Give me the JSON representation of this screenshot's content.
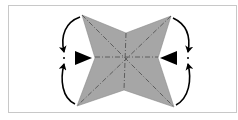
{
  "diagram": {
    "type": "origami-fold-step",
    "colors": {
      "paper": "#a6a6a6",
      "crease": "#555555",
      "arrow": "#000000",
      "frame": "#c8c8c8",
      "background": "#ffffff"
    },
    "shape": {
      "vertices": {
        "top_left": [
          82,
          15
        ],
        "top_notch": [
          126,
          33
        ],
        "top_right": [
          171,
          16
        ],
        "right_notch": [
          158,
          58
        ],
        "bottom_right": [
          174,
          107
        ],
        "bottom_notch": [
          124,
          90
        ],
        "bottom_left": [
          77,
          106
        ],
        "left_notch": [
          95,
          58
        ]
      },
      "center": [
        126,
        56
      ]
    },
    "symbols": [
      {
        "name": "push-arrow-left",
        "meaning": "push in / squash"
      },
      {
        "name": "push-arrow-right",
        "meaning": "push in / squash"
      },
      {
        "name": "fold-arrow-top-left",
        "meaning": "fold corner down to meet"
      },
      {
        "name": "fold-arrow-bottom-left",
        "meaning": "fold corner up to meet"
      },
      {
        "name": "fold-arrow-top-right",
        "meaning": "fold corner down to meet"
      },
      {
        "name": "fold-arrow-bottom-right",
        "meaning": "fold corner up to meet"
      }
    ]
  }
}
